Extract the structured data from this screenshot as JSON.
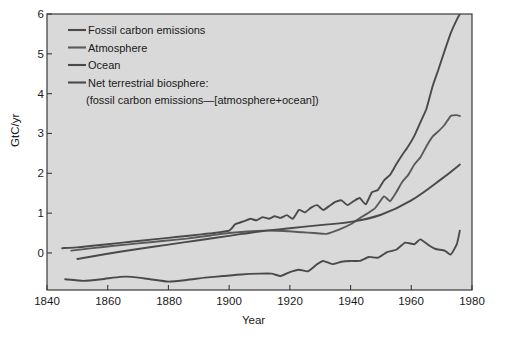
{
  "chart_data": {
    "type": "line",
    "title": "",
    "xlabel": "Year",
    "ylabel": "GtC/yr",
    "xlim": [
      1840,
      1980
    ],
    "ylim": [
      -0.93,
      6.0
    ],
    "xticks": [
      1840,
      1860,
      1880,
      1900,
      1920,
      1940,
      1960,
      1980
    ],
    "yticks": [
      0,
      1,
      2,
      3,
      4,
      5,
      6
    ],
    "grid": false,
    "legend_position": "upper-left",
    "background": "#d9d9d9",
    "line_color": "#4a4a4a",
    "series": [
      {
        "name": "Fossil carbon emissions",
        "color": "#4a4a4a",
        "x": [
          1845,
          1850,
          1855,
          1860,
          1865,
          1870,
          1875,
          1880,
          1885,
          1890,
          1895,
          1900,
          1902,
          1905,
          1907,
          1909,
          1911,
          1913,
          1915,
          1917,
          1919,
          1921,
          1923,
          1925,
          1927,
          1929,
          1931,
          1933,
          1935,
          1937,
          1939,
          1941,
          1943,
          1945,
          1947,
          1949,
          1951,
          1953,
          1955,
          1957,
          1959,
          1961,
          1963,
          1965,
          1967,
          1969,
          1971,
          1973,
          1975,
          1976
        ],
        "values": [
          0.12,
          0.14,
          0.18,
          0.22,
          0.26,
          0.3,
          0.34,
          0.38,
          0.42,
          0.46,
          0.5,
          0.56,
          0.72,
          0.8,
          0.86,
          0.82,
          0.9,
          0.86,
          0.92,
          0.88,
          0.95,
          0.86,
          1.08,
          1.02,
          1.14,
          1.2,
          1.08,
          1.18,
          1.28,
          1.32,
          1.2,
          1.3,
          1.38,
          1.22,
          1.52,
          1.58,
          1.82,
          1.96,
          2.22,
          2.46,
          2.68,
          2.94,
          3.28,
          3.62,
          4.18,
          4.62,
          5.08,
          5.52,
          5.86,
          6.0
        ]
      },
      {
        "name": "Atmosphere",
        "color": "#5a5a5a",
        "x": [
          1848,
          1855,
          1862,
          1870,
          1878,
          1886,
          1894,
          1900,
          1906,
          1912,
          1918,
          1924,
          1928,
          1932,
          1936,
          1940,
          1944,
          1948,
          1951,
          1953,
          1955,
          1957,
          1959,
          1961,
          1963,
          1965,
          1967,
          1969,
          1971,
          1973,
          1975,
          1976
        ],
        "values": [
          0.06,
          0.12,
          0.18,
          0.24,
          0.3,
          0.36,
          0.44,
          0.5,
          0.54,
          0.56,
          0.55,
          0.52,
          0.5,
          0.48,
          0.58,
          0.72,
          0.92,
          1.12,
          1.42,
          1.3,
          1.52,
          1.78,
          1.96,
          2.22,
          2.4,
          2.68,
          2.92,
          3.06,
          3.22,
          3.44,
          3.46,
          3.44
        ]
      },
      {
        "name": "Ocean",
        "color": "#4a4a4a",
        "x": [
          1850,
          1860,
          1870,
          1880,
          1890,
          1900,
          1910,
          1920,
          1930,
          1940,
          1950,
          1960,
          1970,
          1976
        ],
        "values": [
          -0.15,
          -0.02,
          0.1,
          0.21,
          0.32,
          0.43,
          0.54,
          0.62,
          0.7,
          0.78,
          0.96,
          1.32,
          1.86,
          2.22
        ]
      },
      {
        "name": "Net terrestrial biosphere: (fossil carbon emissions—[atmosphere+ocean])",
        "color": "#4a4a4a",
        "x": [
          1846,
          1852,
          1858,
          1864,
          1868,
          1874,
          1880,
          1886,
          1892,
          1898,
          1904,
          1910,
          1914,
          1917,
          1920,
          1923,
          1926,
          1929,
          1931,
          1934,
          1937,
          1940,
          1943,
          1946,
          1949,
          1952,
          1955,
          1958,
          1961,
          1963,
          1966,
          1968,
          1971,
          1973,
          1975,
          1976
        ],
        "values": [
          -0.66,
          -0.7,
          -0.66,
          -0.6,
          -0.6,
          -0.66,
          -0.72,
          -0.68,
          -0.62,
          -0.58,
          -0.54,
          -0.52,
          -0.52,
          -0.58,
          -0.48,
          -0.42,
          -0.46,
          -0.28,
          -0.2,
          -0.28,
          -0.22,
          -0.2,
          -0.2,
          -0.1,
          -0.12,
          0.02,
          0.08,
          0.26,
          0.22,
          0.34,
          0.18,
          0.1,
          0.06,
          -0.04,
          0.22,
          0.56
        ]
      }
    ],
    "legend_entries": [
      {
        "label": "Fossil carbon emissions"
      },
      {
        "label": "Atmosphere"
      },
      {
        "label": "Ocean"
      },
      {
        "label": "Net terrestrial biosphere:"
      },
      {
        "label": "(fossil carbon emissions—[atmosphere+ocean])"
      }
    ]
  },
  "axes": {
    "ylabel": "GtC/yr",
    "xlabel": "Year",
    "ytick_labels": [
      "6",
      "5",
      "4",
      "3",
      "2",
      "1",
      "0"
    ],
    "xtick_labels": [
      "1840",
      "1860",
      "1880",
      "1900",
      "1920",
      "1940",
      "1960",
      "1980"
    ]
  }
}
